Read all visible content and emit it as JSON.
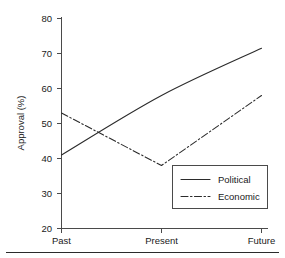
{
  "chart_data": {
    "type": "line",
    "title": "",
    "xlabel": "",
    "ylabel": "Approval (%)",
    "categories": [
      "Past",
      "Present",
      "Future"
    ],
    "ylim": [
      20,
      80
    ],
    "yticks": [
      20,
      30,
      40,
      50,
      60,
      70,
      80
    ],
    "ytick_labels": [
      "20",
      "30",
      "40",
      "50",
      "60",
      "70",
      "80"
    ],
    "grid": false,
    "legend_position": "lower right",
    "series": [
      {
        "name": "Political",
        "values": [
          41,
          58,
          71.5
        ],
        "linestyle": "solid",
        "color": "#2b2b2b"
      },
      {
        "name": "Economic",
        "values": [
          53,
          38,
          58
        ],
        "linestyle": "dash-dot",
        "color": "#2b2b2b"
      }
    ]
  },
  "axis": {
    "y_title": "Approval (%)",
    "y_tick_0": "20",
    "y_tick_1": "30",
    "y_tick_2": "40",
    "y_tick_3": "50",
    "y_tick_4": "60",
    "y_tick_5": "70",
    "y_tick_6": "80",
    "x_tick_0": "Past",
    "x_tick_1": "Present",
    "x_tick_2": "Future"
  },
  "legend": {
    "entry_0_label": "Political",
    "entry_1_label": "Economic"
  },
  "colors": {
    "axis": "#4a4a4a",
    "line": "#2b2b2b",
    "background": "#ffffff"
  }
}
